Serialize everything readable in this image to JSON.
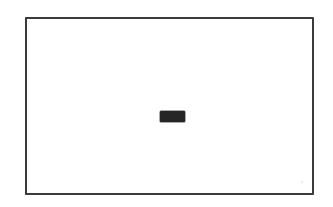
{
  "sketch": {
    "type": "wireframe",
    "frame": {
      "stroke_color": "#3a3a3a",
      "background": "#ffffff"
    },
    "center_element": {
      "kind": "button",
      "label": "",
      "fill_color": "#262626"
    }
  }
}
